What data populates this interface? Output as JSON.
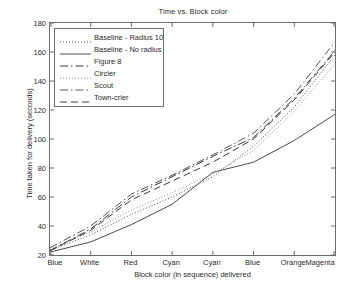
{
  "chart_data": {
    "type": "line",
    "title": "Time vs. Block color",
    "xlabel": "Block color (in sequence) delivered",
    "ylabel": "Time taken for delivery (seconds)",
    "categories": [
      "Blue",
      "White",
      "Red",
      "Cyan",
      "Cyan",
      "Blue",
      "Orange",
      "Magenta"
    ],
    "ylim": [
      20,
      180
    ],
    "yticks": [
      20,
      40,
      60,
      80,
      100,
      120,
      140,
      160,
      180
    ],
    "grid": false,
    "legend_position": "upper left",
    "series": [
      {
        "name": "Baseline - Radius 10",
        "style": "dotted",
        "color": "#4d4d4d",
        "values": [
          23,
          34,
          48,
          60,
          74,
          95,
          122,
          158
        ]
      },
      {
        "name": "Baseline - No radius",
        "style": "solid",
        "color": "#4d4d4d",
        "values": [
          22,
          29,
          41,
          55,
          77,
          84,
          99,
          117
        ]
      },
      {
        "name": "Figure 8",
        "style": "dashdot",
        "color": "#3a3a3a",
        "values": [
          23,
          38,
          60,
          74,
          88,
          101,
          128,
          161
        ]
      },
      {
        "name": "Circler",
        "style": "dotted",
        "color": "#8a8a8a",
        "values": [
          24,
          36,
          51,
          63,
          76,
          92,
          119,
          152
        ]
      },
      {
        "name": "Scout",
        "style": "dashdot",
        "color": "#555555",
        "values": [
          25,
          40,
          62,
          75,
          89,
          104,
          131,
          167
        ]
      },
      {
        "name": "Town-crier",
        "style": "dashed",
        "color": "#3a3a3a",
        "values": [
          23,
          37,
          58,
          71,
          84,
          100,
          127,
          160
        ]
      }
    ]
  }
}
